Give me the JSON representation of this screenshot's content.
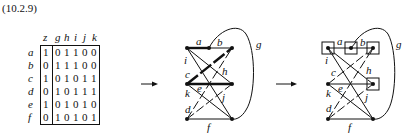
{
  "equation_number": "(10.2.9)",
  "matrix": {
    "column_headers": [
      "z",
      "g",
      "h",
      "i",
      "j",
      "k"
    ],
    "row_labels": [
      "a",
      "b",
      "c",
      "d",
      "e",
      "f"
    ],
    "rows": [
      [
        "1",
        "0",
        "1",
        "1",
        "0",
        "0"
      ],
      [
        "0",
        "1",
        "1",
        "1",
        "0",
        "0"
      ],
      [
        "1",
        "0",
        "1",
        "0",
        "1",
        "1"
      ],
      [
        "0",
        "1",
        "0",
        "1",
        "1",
        "1"
      ],
      [
        "1",
        "0",
        "1",
        "0",
        "1",
        "0"
      ],
      [
        "0",
        "1",
        "0",
        "1",
        "0",
        "1"
      ]
    ]
  },
  "arrows": [
    {
      "name": "arrow-1",
      "glyph": "→"
    },
    {
      "name": "arrow-2",
      "glyph": "→"
    }
  ],
  "graphs": [
    {
      "name": "graph-middle",
      "edge_labels": {
        "a": "a",
        "b": "b",
        "g": "g",
        "i": "i",
        "c": "c",
        "h": "h",
        "k": "k",
        "e": "e",
        "j": "j",
        "d": "d",
        "f": "f"
      },
      "thick_edges": [
        "a",
        "c",
        "ML-MR"
      ],
      "boxed_nodes": []
    },
    {
      "name": "graph-right",
      "edge_labels": {
        "a": "a",
        "b": "b",
        "g": "g",
        "i": "i",
        "c": "c",
        "h": "h",
        "k": "k",
        "e": "e",
        "j": "j",
        "d": "d",
        "f": "f"
      },
      "thick_edges": [],
      "boxed_nodes": [
        "TL",
        "TM",
        "TR",
        "MR"
      ]
    }
  ],
  "colors": {
    "ink": "#111111",
    "background": "#ffffff"
  }
}
